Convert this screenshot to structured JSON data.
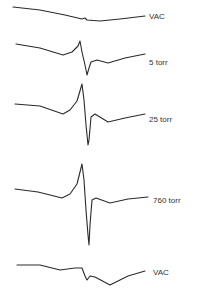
{
  "chart_data": {
    "type": "line",
    "title": "",
    "xlabel": "",
    "ylabel": "",
    "grid": false,
    "legend_position": "inline-right",
    "series": [
      {
        "name": "VAC",
        "position": "top",
        "points": [
          [
            13,
            7
          ],
          [
            40,
            10
          ],
          [
            65,
            15
          ],
          [
            82,
            19
          ],
          [
            85,
            18
          ],
          [
            87,
            20
          ],
          [
            100,
            21
          ],
          [
            120,
            19
          ],
          [
            145,
            16
          ]
        ],
        "label_xy": [
          148,
          12
        ]
      },
      {
        "name": "5 torr",
        "position": "second",
        "points": [
          [
            16,
            44
          ],
          [
            40,
            48
          ],
          [
            63,
            55
          ],
          [
            72,
            52
          ],
          [
            78,
            46
          ],
          [
            80,
            41
          ],
          [
            82,
            52
          ],
          [
            85,
            65
          ],
          [
            87,
            75
          ],
          [
            89,
            68
          ],
          [
            91,
            62
          ],
          [
            97,
            60
          ],
          [
            108,
            63
          ],
          [
            125,
            58
          ],
          [
            145,
            54
          ]
        ],
        "label_xy": [
          148,
          58
        ]
      },
      {
        "name": "25 torr",
        "position": "third",
        "points": [
          [
            15,
            104
          ],
          [
            40,
            106
          ],
          [
            63,
            114
          ],
          [
            70,
            110
          ],
          [
            77,
            101
          ],
          [
            82,
            84
          ],
          [
            84,
            100
          ],
          [
            86,
            125
          ],
          [
            88,
            145
          ],
          [
            89,
            140
          ],
          [
            91,
            117
          ],
          [
            95,
            114
          ],
          [
            108,
            122
          ],
          [
            125,
            118
          ],
          [
            145,
            114
          ]
        ],
        "label_xy": [
          148,
          115
        ]
      },
      {
        "name": "760 torr",
        "position": "fourth",
        "points": [
          [
            15,
            189
          ],
          [
            38,
            192
          ],
          [
            62,
            198
          ],
          [
            70,
            194
          ],
          [
            77,
            184
          ],
          [
            82,
            164
          ],
          [
            84,
            180
          ],
          [
            86,
            210
          ],
          [
            88,
            235
          ],
          [
            89,
            245
          ],
          [
            90,
            225
          ],
          [
            92,
            200
          ],
          [
            96,
            198
          ],
          [
            110,
            203
          ],
          [
            128,
            199
          ],
          [
            148,
            197
          ]
        ],
        "label_xy": [
          152,
          196
        ]
      },
      {
        "name": "VAC",
        "position": "bottom",
        "points": [
          [
            17,
            265
          ],
          [
            40,
            265
          ],
          [
            60,
            270
          ],
          [
            75,
            268
          ],
          [
            82,
            268
          ],
          [
            85,
            276
          ],
          [
            87,
            280
          ],
          [
            90,
            276
          ],
          [
            95,
            277
          ],
          [
            110,
            285
          ],
          [
            128,
            276
          ],
          [
            145,
            271
          ]
        ],
        "label_xy": [
          152,
          268
        ]
      }
    ]
  },
  "labels": {
    "vac_top": "VAC",
    "torr_5": "5 torr",
    "torr_25": "25 torr",
    "torr_760": "760 torr",
    "vac_bottom": "VAC"
  }
}
